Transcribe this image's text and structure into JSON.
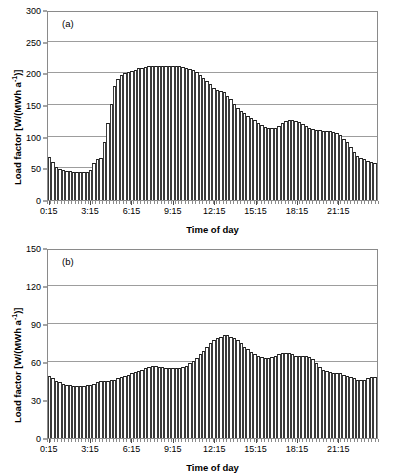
{
  "figure": {
    "panels": [
      {
        "tag": "(a)",
        "xlabel": "Time of day",
        "ylabel_main": "Load factor [W/(MWh a",
        "ylabel_sup": "-1",
        "ylabel_tail": ")]"
      },
      {
        "tag": "(b)",
        "xlabel": "Time of day",
        "ylabel_main": "Load factor [W/(MWh a",
        "ylabel_sup": "-1",
        "ylabel_tail": ")]"
      }
    ]
  },
  "chart_data": [
    {
      "type": "bar",
      "title": "(a)",
      "xlabel": "Time of day",
      "ylabel": "Load factor [W/(MWh a^-1)]",
      "ylim": [
        0,
        300
      ],
      "yticks": [
        0,
        50,
        100,
        150,
        200,
        250,
        300
      ],
      "xticks": [
        "0:15",
        "3:15",
        "6:15",
        "9:15",
        "12:15",
        "15:15",
        "18:15",
        "21:15"
      ],
      "xtick_indices": [
        0,
        12,
        24,
        36,
        48,
        60,
        72,
        84
      ],
      "grid": true,
      "legend": "none",
      "categories": [
        "0:15",
        "0:30",
        "0:45",
        "1:00",
        "1:15",
        "1:30",
        "1:45",
        "2:00",
        "2:15",
        "2:30",
        "2:45",
        "3:00",
        "3:15",
        "3:30",
        "3:45",
        "4:00",
        "4:15",
        "4:30",
        "4:45",
        "5:00",
        "5:15",
        "5:30",
        "5:45",
        "6:00",
        "6:15",
        "6:30",
        "6:45",
        "7:00",
        "7:15",
        "7:30",
        "7:45",
        "8:00",
        "8:15",
        "8:30",
        "8:45",
        "9:00",
        "9:15",
        "9:30",
        "9:45",
        "10:00",
        "10:15",
        "10:30",
        "10:45",
        "11:00",
        "11:15",
        "11:30",
        "11:45",
        "12:00",
        "12:15",
        "12:30",
        "12:45",
        "13:00",
        "13:15",
        "13:30",
        "13:45",
        "14:00",
        "14:15",
        "14:30",
        "14:45",
        "15:00",
        "15:15",
        "15:30",
        "15:45",
        "16:00",
        "16:15",
        "16:30",
        "16:45",
        "17:00",
        "17:15",
        "17:30",
        "17:45",
        "18:00",
        "18:15",
        "18:30",
        "18:45",
        "19:00",
        "19:15",
        "19:30",
        "19:45",
        "20:00",
        "20:15",
        "20:30",
        "20:45",
        "21:00",
        "21:15",
        "21:30",
        "21:45",
        "22:00",
        "22:15",
        "22:30",
        "22:45",
        "23:00",
        "23:15",
        "23:30",
        "23:45",
        "24:00"
      ],
      "values": [
        68,
        60,
        52,
        49,
        47,
        46,
        46,
        45,
        45,
        44,
        44,
        45,
        48,
        58,
        64,
        66,
        92,
        122,
        152,
        180,
        191,
        197,
        200,
        202,
        204,
        206,
        208,
        209,
        210,
        211,
        211,
        211,
        211,
        211,
        211,
        211,
        211,
        211,
        211,
        210,
        209,
        207,
        205,
        202,
        198,
        193,
        188,
        183,
        177,
        174,
        172,
        170,
        165,
        159,
        152,
        146,
        141,
        137,
        133,
        130,
        126,
        122,
        118,
        115,
        113,
        113,
        114,
        117,
        121,
        124,
        126,
        126,
        125,
        123,
        120,
        117,
        114,
        112,
        111,
        110,
        109,
        109,
        109,
        108,
        106,
        102,
        97,
        91,
        84,
        76,
        70,
        66,
        64,
        62,
        60,
        59
      ]
    },
    {
      "type": "bar",
      "title": "(b)",
      "xlabel": "Time of day",
      "ylabel": "Load factor [W/(MWh a^-1)]",
      "ylim": [
        0,
        150
      ],
      "yticks": [
        0,
        30,
        60,
        90,
        120,
        150
      ],
      "xticks": [
        "0:15",
        "3:15",
        "6:15",
        "9:15",
        "12:15",
        "15:15",
        "18:15",
        "21:15"
      ],
      "xtick_indices": [
        0,
        12,
        24,
        36,
        48,
        60,
        72,
        84
      ],
      "grid": true,
      "legend": "none",
      "categories": [
        "0:15",
        "0:30",
        "0:45",
        "1:00",
        "1:15",
        "1:30",
        "1:45",
        "2:00",
        "2:15",
        "2:30",
        "2:45",
        "3:00",
        "3:15",
        "3:30",
        "3:45",
        "4:00",
        "4:15",
        "4:30",
        "4:45",
        "5:00",
        "5:15",
        "5:30",
        "5:45",
        "6:00",
        "6:15",
        "6:30",
        "6:45",
        "7:00",
        "7:15",
        "7:30",
        "7:45",
        "8:00",
        "8:15",
        "8:30",
        "8:45",
        "9:00",
        "9:15",
        "9:30",
        "9:45",
        "10:00",
        "10:15",
        "10:30",
        "10:45",
        "11:00",
        "11:15",
        "11:30",
        "11:45",
        "12:00",
        "12:15",
        "12:30",
        "12:45",
        "13:00",
        "13:15",
        "13:30",
        "13:45",
        "14:00",
        "14:15",
        "14:30",
        "14:45",
        "15:00",
        "15:15",
        "15:30",
        "15:45",
        "16:00",
        "16:15",
        "16:30",
        "16:45",
        "17:00",
        "17:15",
        "17:30",
        "17:45",
        "18:00",
        "18:15",
        "18:30",
        "18:45",
        "19:00",
        "19:15",
        "19:30",
        "19:45",
        "20:00",
        "20:15",
        "20:30",
        "20:45",
        "21:00",
        "21:15",
        "21:30",
        "21:45",
        "22:00",
        "22:15",
        "22:30",
        "22:45",
        "23:00",
        "23:15",
        "23:30",
        "23:45",
        "24:00"
      ],
      "values": [
        49,
        47,
        45,
        44,
        43,
        42,
        42,
        41,
        41,
        41,
        41,
        42,
        42,
        43,
        44,
        45,
        45,
        45,
        46,
        46,
        47,
        48,
        49,
        50,
        51,
        52,
        53,
        54,
        55,
        56,
        57,
        57,
        56,
        56,
        55,
        55,
        55,
        55,
        55,
        56,
        57,
        59,
        61,
        63,
        66,
        69,
        72,
        75,
        77,
        79,
        80,
        81,
        81,
        80,
        79,
        77,
        75,
        72,
        70,
        68,
        66,
        65,
        64,
        63,
        63,
        64,
        65,
        66,
        67,
        67,
        67,
        66,
        65,
        65,
        65,
        65,
        64,
        62,
        59,
        56,
        54,
        53,
        52,
        51,
        51,
        51,
        50,
        49,
        48,
        47,
        46,
        46,
        46,
        47,
        48,
        48
      ]
    }
  ]
}
